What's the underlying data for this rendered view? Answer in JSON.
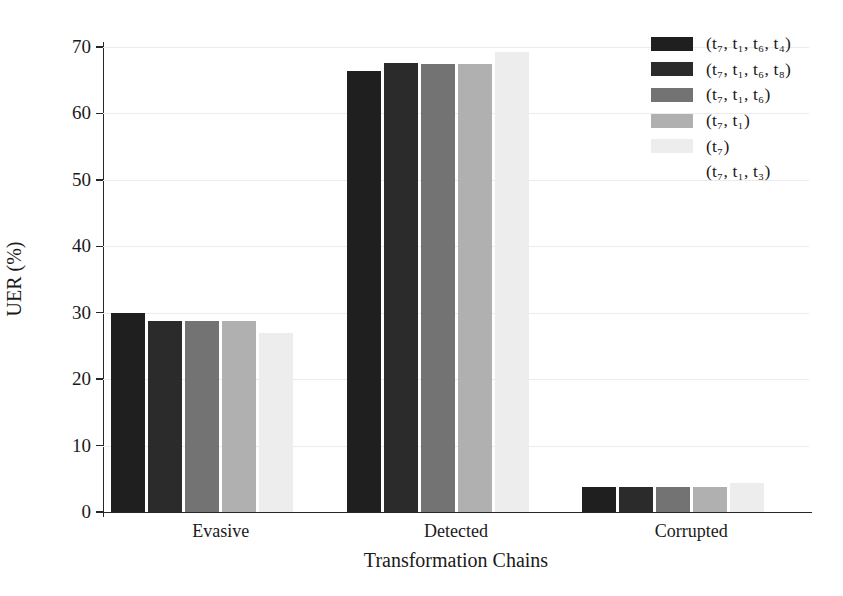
{
  "chart_data": {
    "type": "bar",
    "title": "",
    "xlabel": "Transformation Chains",
    "ylabel": "UER (%)",
    "categories": [
      "Evasive",
      "Detected",
      "Corrupted"
    ],
    "ylim": [
      0,
      70
    ],
    "yticks": [
      0,
      10,
      20,
      30,
      40,
      50,
      60,
      70
    ],
    "ytick_labels": [
      "0",
      "10",
      "20",
      "30",
      "40",
      "50",
      "60",
      "70"
    ],
    "grid": true,
    "legend_position": "upper right",
    "series": [
      {
        "name": "(t7, t1, t6, t4)",
        "label": "(t₇, t₁, t₆, t₄)",
        "color": "#1f1f1f",
        "values": [
          30.0,
          66.4,
          3.7
        ]
      },
      {
        "name": "(t7, t1, t6, t8)",
        "label": "(t₇, t₁, t₆, t₈)",
        "color": "#2b2b2b",
        "values": [
          28.8,
          67.6,
          3.7
        ]
      },
      {
        "name": "(t7, t1, t6)",
        "label": "(t₇, t₁, t₆)",
        "color": "#737373",
        "values": [
          28.8,
          67.4,
          3.7
        ]
      },
      {
        "name": "(t7, t1)",
        "label": "(t₇, t₁)",
        "color": "#b0b0b0",
        "values": [
          28.8,
          67.4,
          3.7
        ]
      },
      {
        "name": "(t7)",
        "label": "(t₇)",
        "color": "#ededed",
        "values": [
          27.0,
          69.3,
          4.3
        ]
      },
      {
        "name": "(t7, t1, t3)",
        "label": "(t₇, t₁, t₃)",
        "color": "#ffffff",
        "values": [
          0.0,
          0.0,
          0.0
        ]
      }
    ]
  },
  "axes": {
    "x_title": "Transformation Chains",
    "y_title": "UER (%)"
  },
  "colors": {
    "axis": "#262626",
    "grid": "#ececec",
    "text": "#1a1a1a",
    "background": "#ffffff"
  }
}
